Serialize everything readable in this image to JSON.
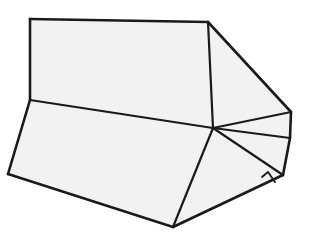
{
  "figure": {
    "name": "polyhedron-wireframe",
    "type": "line-drawing",
    "canvas": {
      "width": 309,
      "height": 237
    },
    "colors": {
      "background": "#ffffff",
      "face_fill": "#f2f2f2",
      "edge_stroke": "#1a1a1a"
    },
    "stroke_widths": {
      "outline": 2.6,
      "interior": 2.2,
      "detail": 1.8
    },
    "vertices": {
      "A_top_left": [
        30,
        19
      ],
      "B_top_right": [
        208,
        22
      ],
      "C_right_upper": [
        291,
        112
      ],
      "D_right_mid": [
        290,
        138
      ],
      "E_right_lower": [
        283,
        175
      ],
      "H_hub": [
        213,
        128
      ],
      "L_left_mid": [
        30,
        100
      ],
      "BL_bottom_left": [
        8,
        174
      ],
      "BC_bottom_center": [
        173,
        227
      ],
      "T1_tab_left": [
        262,
        177
      ],
      "T2_tab_right": [
        275,
        182
      ],
      "T3_tab_inner": [
        268,
        172
      ]
    },
    "faces": [
      {
        "id": "face-top-large",
        "label": "Large upper quadrilateral face",
        "points": "30,19 208,22 213,128 30,100"
      },
      {
        "id": "face-right-upper",
        "label": "Upper right triangular face",
        "points": "208,22 291,112 213,128"
      },
      {
        "id": "face-right-sliver",
        "label": "Narrow right sliver face",
        "points": "213,128 291,112 290,138"
      },
      {
        "id": "face-right-lower",
        "label": "Lower right triangular face",
        "points": "213,128 290,138 283,175"
      },
      {
        "id": "face-front-left",
        "label": "Large front-left quadrilateral",
        "points": "30,100 213,128 173,227 8,174"
      },
      {
        "id": "face-front-right",
        "label": "Front right triangular face",
        "points": "213,128 283,175 173,227"
      }
    ],
    "edges": [
      {
        "id": "edge-A-B",
        "label": "top edge",
        "d": "M30,19 L208,22",
        "weight": "outline"
      },
      {
        "id": "edge-B-C",
        "label": "upper right slanted edge",
        "d": "M208,22 L291,112",
        "weight": "outline"
      },
      {
        "id": "edge-C-D",
        "label": "right short edge",
        "d": "M291,112 L290,138",
        "weight": "outline"
      },
      {
        "id": "edge-D-E",
        "label": "right lower edge",
        "d": "M290,138 L283,175",
        "weight": "outline"
      },
      {
        "id": "edge-E-BC",
        "label": "bottom right edge",
        "d": "M283,175 L173,227",
        "weight": "outline"
      },
      {
        "id": "edge-BC-BL",
        "label": "bottom left edge",
        "d": "M173,227 L8,174",
        "weight": "outline"
      },
      {
        "id": "edge-BL-L",
        "label": "left edge",
        "d": "M8,174 L30,100",
        "weight": "outline"
      },
      {
        "id": "edge-L-A",
        "label": "upper left vertical edge",
        "d": "M30,100 L30,19",
        "weight": "outline"
      },
      {
        "id": "edge-B-H",
        "label": "interior vertical edge",
        "d": "M208,22 L213,128",
        "weight": "interior"
      },
      {
        "id": "edge-L-H",
        "label": "interior horizontal edge",
        "d": "M30,100 L213,128",
        "weight": "interior"
      },
      {
        "id": "edge-H-C",
        "label": "hub to right upper vertex",
        "d": "M213,128 L291,112",
        "weight": "interior"
      },
      {
        "id": "edge-H-D",
        "label": "hub to right mid vertex",
        "d": "M213,128 L290,138",
        "weight": "interior"
      },
      {
        "id": "edge-H-E",
        "label": "hub to right lower vertex",
        "d": "M213,128 L283,175",
        "weight": "interior"
      },
      {
        "id": "edge-H-BC",
        "label": "hub to bottom center",
        "d": "M213,128 L173,227",
        "weight": "interior"
      },
      {
        "id": "edge-tab",
        "label": "small bottom-right tab notch",
        "d": "M262,177 L268,172 L275,182",
        "weight": "detail"
      }
    ]
  }
}
